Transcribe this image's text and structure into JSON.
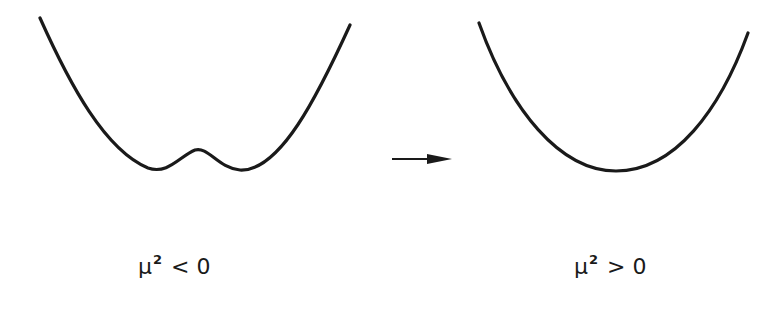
{
  "diagram": {
    "left_panel": {
      "description": "double-well potential",
      "label": {
        "symbol": "μ",
        "exponent": "2",
        "operator": "<",
        "value": "0"
      }
    },
    "transition": {
      "description": "arrow pointing right"
    },
    "right_panel": {
      "description": "single-well parabola potential",
      "label": {
        "symbol": "μ",
        "exponent": "2",
        "operator": ">",
        "value": "0"
      }
    },
    "colors": {
      "stroke": "#1a1a1a",
      "background": "#ffffff"
    }
  }
}
